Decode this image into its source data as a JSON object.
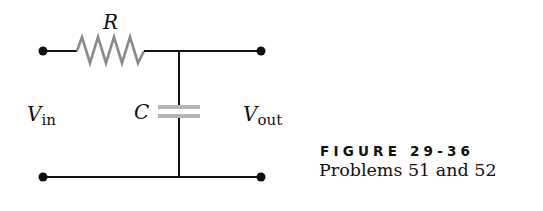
{
  "figure": {
    "title": "FIGURE 29-36",
    "caption": "Problems 51 and 52"
  },
  "circuit": {
    "type": "RC low-pass filter",
    "components": [
      {
        "id": "resistor",
        "label": "R",
        "color": "#8a8a8a"
      },
      {
        "id": "capacitor",
        "label": "C",
        "color": "#b5b5b5"
      }
    ],
    "terminals": {
      "input": {
        "label": "V",
        "subscript": "in"
      },
      "output": {
        "label": "V",
        "subscript": "out"
      }
    },
    "wire_color": "#111111"
  }
}
